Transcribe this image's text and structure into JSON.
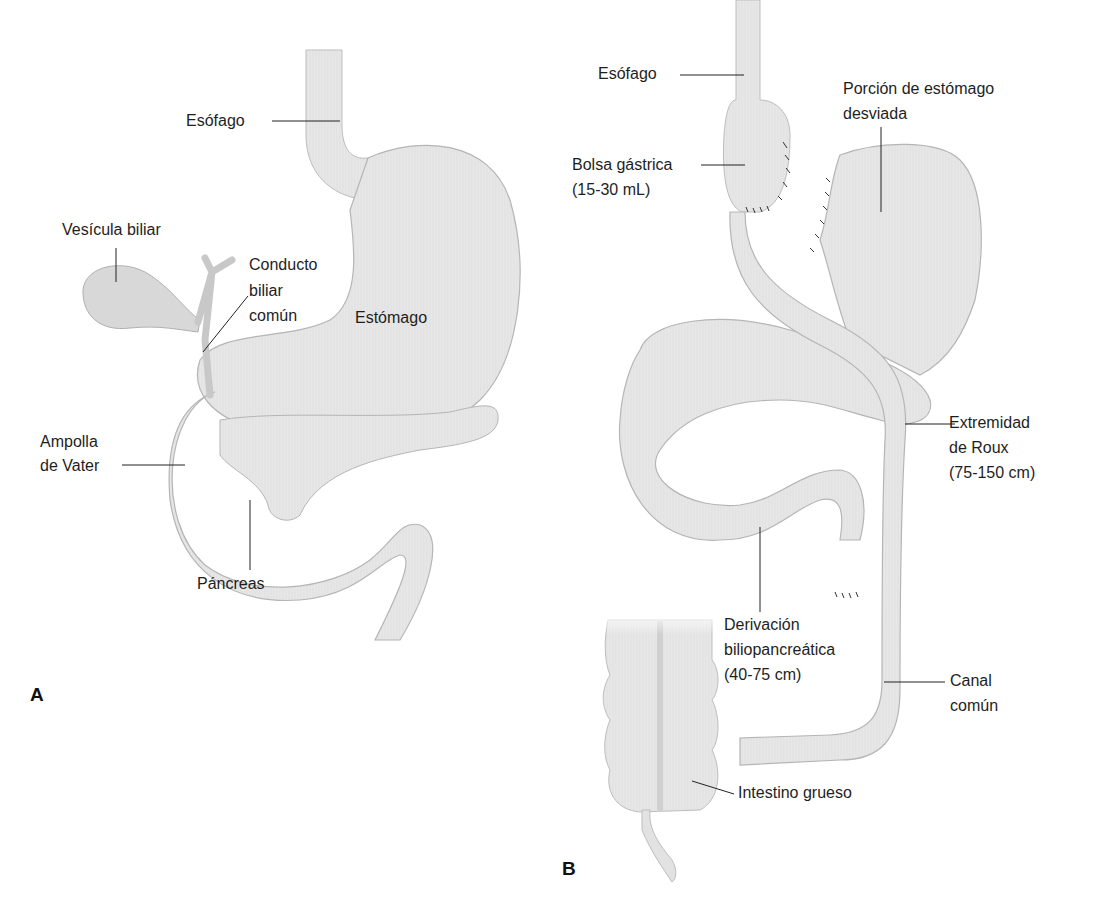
{
  "figure": {
    "panels": [
      {
        "id": "A",
        "letter": "A",
        "labels": {
          "esofago": "Esófago",
          "vesicula": "Vesícula biliar",
          "conducto_1": "Conducto",
          "conducto_2": "biliar",
          "conducto_3": "común",
          "estomago": "Estómago",
          "ampolla_1": "Ampolla",
          "ampolla_2": "de Vater",
          "pancreas": "Páncreas"
        }
      },
      {
        "id": "B",
        "letter": "B",
        "labels": {
          "esofago": "Esófago",
          "porcion_1": "Porción de estómago",
          "porcion_2": "desviada",
          "bolsa_1": "Bolsa gástrica",
          "bolsa_2": "(15-30 mL)",
          "roux_1": "Extremidad",
          "roux_2": "de Roux",
          "roux_3": "(75-150 cm)",
          "deriv_1": "Derivación",
          "deriv_2": "biliopancreática",
          "deriv_3": "(40-75 cm)",
          "canal_1": "Canal",
          "canal_2": "común",
          "intestino": "Intestino grueso"
        }
      }
    ],
    "colors": {
      "organ_fill": "#e6e6e6",
      "organ_stroke": "#b5b5b5",
      "leader_line": "#222222",
      "suture": "#333333"
    }
  }
}
